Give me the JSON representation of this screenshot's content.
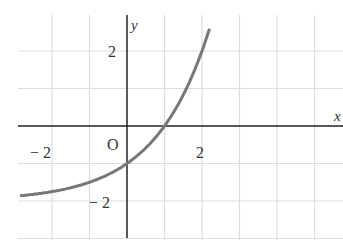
{
  "chart_data": {
    "type": "line",
    "title": "",
    "function": "y = 2^x - 2",
    "xlabel": "x",
    "ylabel": "y",
    "origin_label": "O",
    "xlim": [
      -2.9,
      5.2
    ],
    "ylim": [
      -3,
      3.0
    ],
    "grid": true,
    "x_ticks": [
      {
        "value": -2,
        "label": "− 2"
      },
      {
        "value": 2,
        "label": "2"
      }
    ],
    "y_ticks": [
      {
        "value": 2,
        "label": "2"
      },
      {
        "value": -2,
        "label": "− 2"
      }
    ],
    "x": [
      -2.85,
      -2,
      -1,
      0,
      1,
      2,
      2.2
    ],
    "y": [
      -1.86,
      -1.75,
      -1.5,
      -1,
      0,
      2,
      2.59
    ],
    "asymptote": -2,
    "colors": {
      "curve": "#777777",
      "axis": "#222222",
      "grid": "#dddddd"
    }
  }
}
